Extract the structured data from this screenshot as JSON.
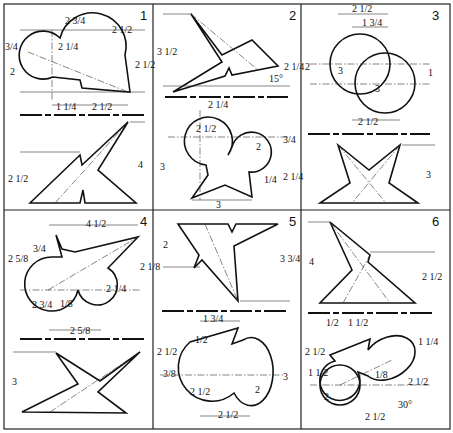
{
  "sheet": {
    "title": "Intersecting solids / development exercises",
    "panels": [
      {
        "number": "1",
        "top_dims": [
          "2 3/4",
          "2 1/4",
          "2 1/2",
          "3/4",
          "2",
          "2 1/2",
          "1 1/4",
          "2 1/2"
        ],
        "bottom_dims": [
          "2 1/2",
          "4"
        ]
      },
      {
        "number": "2",
        "top_dims": [
          "3 1/2",
          "2 1/4",
          "15°"
        ],
        "bottom_dims": [
          "2 1/4",
          "2 1/2",
          "2",
          "3/4",
          "3",
          "2 1/4",
          "1/4",
          "3"
        ]
      },
      {
        "number": "3",
        "top_dims": [
          "2 1/2",
          "1 3/4",
          "2",
          "3",
          "1",
          "3",
          "2 1/2"
        ],
        "bottom_dims": [
          "3"
        ]
      },
      {
        "number": "4",
        "top_dims": [
          "4 1/2",
          "3/4",
          "2 5/8",
          "2 1/8",
          "2 3/4",
          "2 1/4",
          "1/8",
          "2 5/8"
        ],
        "bottom_dims": [
          "3"
        ]
      },
      {
        "number": "5",
        "top_dims": [
          "2",
          "3 3/4"
        ],
        "bottom_dims": [
          "1 3/4",
          "1/2",
          "2 1/2",
          "3/8",
          "2 1/2",
          "3",
          "2",
          "2 1/2"
        ]
      },
      {
        "number": "6",
        "top_dims": [
          "4",
          "2 1/2"
        ],
        "bottom_dims": [
          "1/2",
          "1 1/2",
          "2 1/2",
          "1 1/2",
          "1 1/4",
          "2",
          "1/8",
          "2 1/2",
          "2 1/2",
          "30°"
        ]
      }
    ]
  }
}
